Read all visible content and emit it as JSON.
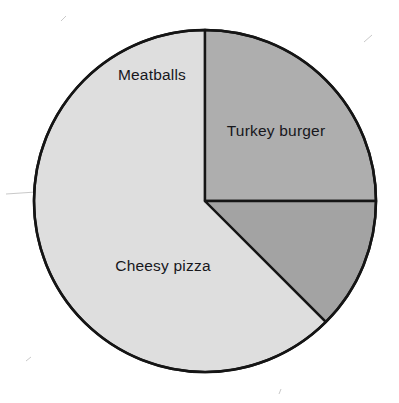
{
  "chart_data": {
    "type": "pie",
    "title": "",
    "subtitle": "",
    "xlabel": "",
    "ylabel": "",
    "legend_position": "none",
    "grid": false,
    "labels_inside_slices": true,
    "total_degrees": 360,
    "categories": [
      "Turkey burger",
      "Cheesy pizza",
      "Meatballs"
    ],
    "values": [
      25,
      62.5,
      12.5
    ],
    "value_unit": "percent",
    "slices": [
      {
        "name": "Turkey burger",
        "label": "Turkey burger",
        "percent": 25,
        "degrees": 90,
        "start_angle_deg": 0,
        "end_angle_deg": 90,
        "fraction": "1/4",
        "color": "#aeaeae"
      },
      {
        "name": "Cheesy pizza",
        "label": "Cheesy pizza",
        "percent": 62.5,
        "degrees": 225,
        "start_angle_deg": 90,
        "end_angle_deg": 315,
        "fraction": "5/8",
        "color": "#dedede"
      },
      {
        "name": "Meatballs",
        "label": "Meatballs",
        "percent": 12.5,
        "degrees": 45,
        "start_angle_deg": 315,
        "end_angle_deg": 360,
        "fraction": "1/8",
        "color": "#a3a3a3"
      }
    ]
  },
  "geometry": {
    "center_x": 205,
    "center_y": 201,
    "radius": 171,
    "stroke_color": "#151515",
    "stroke_width": 2.4,
    "background": "#ffffff"
  },
  "labels": {
    "meatballs": {
      "text": "Meatballs",
      "x": 152,
      "y": 80,
      "anchor": "middle"
    },
    "turkey_burger": {
      "text": "Turkey burger",
      "x": 276,
      "y": 136,
      "anchor": "middle"
    },
    "cheesy_pizza": {
      "text": "Cheesy pizza",
      "x": 163,
      "y": 271,
      "anchor": "middle"
    }
  },
  "colors": {
    "turkey_burger": "#aeaeae",
    "cheesy_pizza": "#dedede",
    "meatballs": "#a3a3a3",
    "outline": "#151515",
    "label_text": "#17171c",
    "page_background": "#ffffff"
  }
}
